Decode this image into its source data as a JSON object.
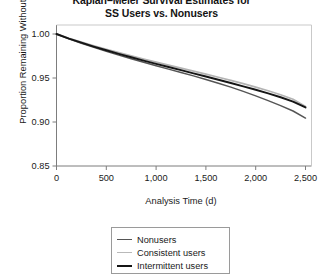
{
  "chart_data": {
    "type": "line",
    "title": "Kaplan–Meier Survival Estimates for",
    "subtitle": "SS Users vs. Nonusers",
    "xlabel": "Analysis Time (d)",
    "ylabel": "Proportion Remaining Without a Fall",
    "xlim": [
      0,
      2500
    ],
    "ylim": [
      0.85,
      1.0
    ],
    "xticks": [
      0,
      500,
      1000,
      1500,
      2000,
      2500
    ],
    "xticklabels": [
      "0",
      "500",
      "1,000",
      "1,500",
      "2,000",
      "2,500"
    ],
    "yticks": [
      0.85,
      0.9,
      0.95,
      1.0
    ],
    "yticklabels": [
      "0.85",
      "0.90",
      "0.95",
      "1.00"
    ],
    "grid": false,
    "legend_position": "bottom-center",
    "x": [
      0,
      125,
      250,
      375,
      500,
      625,
      750,
      875,
      1000,
      1125,
      1250,
      1375,
      1500,
      1625,
      1750,
      1875,
      2000,
      2125,
      2250,
      2375,
      2500
    ],
    "series": [
      {
        "name": "Nonusers",
        "color": "#555555",
        "width": 1.5,
        "values": [
          1.0,
          0.9945,
          0.9895,
          0.9848,
          0.9803,
          0.976,
          0.9718,
          0.9678,
          0.9639,
          0.9601,
          0.9563,
          0.9524,
          0.9484,
          0.9441,
          0.9396,
          0.9348,
          0.9297,
          0.9243,
          0.9186,
          0.9125,
          0.9045
        ]
      },
      {
        "name": "Consistent users",
        "color": "#b4b4b4",
        "width": 1.7,
        "values": [
          1.0,
          0.9952,
          0.9908,
          0.9866,
          0.9826,
          0.9788,
          0.9751,
          0.9715,
          0.968,
          0.9646,
          0.9612,
          0.9578,
          0.9544,
          0.9509,
          0.9473,
          0.9436,
          0.9397,
          0.9355,
          0.9309,
          0.9258,
          0.9175
        ]
      },
      {
        "name": "Intermittent users",
        "color": "#151515",
        "width": 1.9,
        "values": [
          1.0,
          0.9948,
          0.9901,
          0.9857,
          0.9815,
          0.9775,
          0.9736,
          0.9698,
          0.9661,
          0.9625,
          0.9589,
          0.9553,
          0.9517,
          0.948,
          0.9443,
          0.9405,
          0.9366,
          0.9325,
          0.9281,
          0.9232,
          0.9165
        ]
      }
    ]
  },
  "legend": {
    "items": [
      {
        "label": "Nonusers",
        "color": "#555555",
        "thickness": "1.6px"
      },
      {
        "label": "Consistent users",
        "color": "#b9b9b9",
        "thickness": "1.8px"
      },
      {
        "label": "Intermittent users",
        "color": "#151515",
        "thickness": "2.2px"
      }
    ]
  },
  "axes": {
    "line_color": "#7d7d7d"
  }
}
